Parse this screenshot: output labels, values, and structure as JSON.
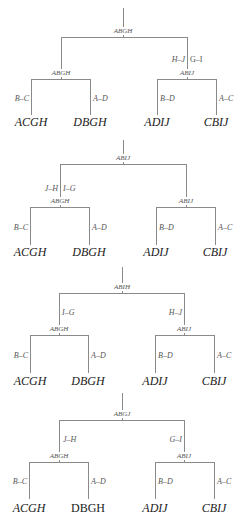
{
  "diagram": {
    "type": "tree-sequence",
    "line_color": "#8a8a8a",
    "trees": [
      {
        "root": "ABGH",
        "left_child": "ABGH",
        "right_child": "ABIJ",
        "left_edge": "",
        "right_edge_left": "H–J",
        "right_edge_right": "G–I",
        "leaves": [
          "ACGH",
          "DBGH",
          "ADIJ",
          "CBIJ"
        ],
        "leaf_edges": [
          "B–C",
          "A–D",
          "B–D",
          "A–C"
        ]
      },
      {
        "root": "ABIJ",
        "left_child": "ABGH",
        "right_child": "ABIJ",
        "left_edge_left": "J–H",
        "left_edge_right": "I–G",
        "right_edge": "",
        "leaves": [
          "ACGH",
          "DBGH",
          "ADIJ",
          "CBIJ"
        ],
        "leaf_edges": [
          "B–C",
          "A–D",
          "B–D",
          "A–C"
        ]
      },
      {
        "root": "ABIH",
        "left_child": "ABGH",
        "right_child": "ABIJ",
        "left_edge": "I–G",
        "right_edge": "H–J",
        "leaves": [
          "ACGH",
          "DBGH",
          "ADIJ",
          "CBIJ"
        ],
        "leaf_edges": [
          "B–C",
          "A–D",
          "B–D",
          "A–C"
        ]
      },
      {
        "root": "ABGJ",
        "left_child": "ABGH",
        "right_child": "ABIJ",
        "left_edge": "J–H",
        "right_edge": "G–I",
        "leaves": [
          "ACGH",
          "DBGH",
          "ADIJ",
          "CBIJ"
        ],
        "leaf_edges": [
          "B–C",
          "A–D",
          "B–D",
          "A–C"
        ]
      }
    ]
  }
}
